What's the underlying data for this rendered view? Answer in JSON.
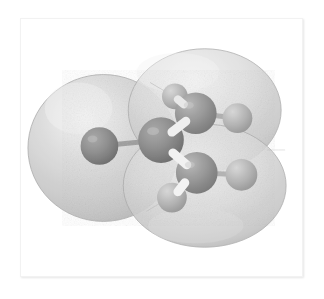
{
  "figure": {
    "kind": "molecular-model",
    "title": "Ball-and-stick molecular model with translucent van der Waals electron-density isosurface",
    "render_style": "grayscale halftone print",
    "background_color": "#ffffff",
    "frame": {
      "x": 20,
      "y": 18,
      "width": 283,
      "height": 259,
      "border_color": "#f2f2f2",
      "fill_color": "#ffffff",
      "shadow_color": "rgba(0,0,0,0.10)"
    }
  },
  "surface": {
    "name": "electron-density-isosurface",
    "opacity": 0.72,
    "fill_light": "#e9e9e9",
    "fill_mid": "#c9c9c9",
    "fill_dark": "#a6a6a6",
    "edge_color": "#9a9a9a",
    "lobes": [
      {
        "name": "left-lobe",
        "cx": 103,
        "cy": 148,
        "rx": 76,
        "ry": 74
      },
      {
        "name": "upper-right-lobe",
        "cx": 205,
        "cy": 110,
        "rx": 77,
        "ry": 62
      },
      {
        "name": "lower-right-lobe",
        "cx": 205,
        "cy": 186,
        "rx": 82,
        "ry": 62
      }
    ]
  },
  "atoms": [
    {
      "id": "A1",
      "label": "heavy-atom-left",
      "element_shade": "dark",
      "cx": 99,
      "cy": 146,
      "r": 19,
      "fill": "#7b7b7b",
      "highlight": "#a8a8a8"
    },
    {
      "id": "A2",
      "label": "carbon-center",
      "element_shade": "dark",
      "cx": 161,
      "cy": 140,
      "r": 23,
      "fill": "#7d7d7d",
      "highlight": "#ababab"
    },
    {
      "id": "A3",
      "label": "carbon-upper-right",
      "element_shade": "mid",
      "cx": 196,
      "cy": 113,
      "r": 21,
      "fill": "#8a8a8a",
      "highlight": "#b4b4b4"
    },
    {
      "id": "A4",
      "label": "carbon-lower-right",
      "element_shade": "mid",
      "cx": 197,
      "cy": 173,
      "r": 21,
      "fill": "#8c8c8c",
      "highlight": "#b6b6b6"
    },
    {
      "id": "A5",
      "label": "hydrogen-top",
      "element_shade": "light",
      "cx": 175,
      "cy": 96,
      "r": 13,
      "fill": "#b2b2b2",
      "highlight": "#d2d2d2"
    },
    {
      "id": "A6",
      "label": "hydrogen-bottom",
      "element_shade": "light",
      "cx": 172,
      "cy": 198,
      "r": 15,
      "fill": "#9f9f9f",
      "highlight": "#c6c6c6"
    },
    {
      "id": "A7",
      "label": "hydrogen-upper-right",
      "element_shade": "light",
      "cx": 238,
      "cy": 118,
      "r": 15,
      "fill": "#aeaeae",
      "highlight": "#cfcfcf"
    },
    {
      "id": "A8",
      "label": "hydrogen-lower-right",
      "element_shade": "light",
      "cx": 242,
      "cy": 175,
      "r": 16,
      "fill": "#b0b0b0",
      "highlight": "#d0d0d0"
    }
  ],
  "bonds": [
    {
      "name": "bond-A1-A2",
      "from": "A1",
      "to": "A2",
      "width": 5,
      "color": "#8f8f8f"
    },
    {
      "name": "bond-A2-A3",
      "from": "A2",
      "to": "A3",
      "width": 10,
      "color": "#e3e3e3"
    },
    {
      "name": "bond-A2-A4",
      "from": "A2",
      "to": "A4",
      "width": 10,
      "color": "#e8e8e8"
    },
    {
      "name": "bond-A3-A5",
      "from": "A3",
      "to": "A5",
      "width": 8,
      "color": "#dcdcdc"
    },
    {
      "name": "bond-A3-A7",
      "from": "A3",
      "to": "A7",
      "width": 5,
      "color": "#9e9e9e"
    },
    {
      "name": "bond-A4-A6",
      "from": "A4",
      "to": "A6",
      "width": 9,
      "color": "#f0f0f0"
    },
    {
      "name": "bond-A4-A8",
      "from": "A4",
      "to": "A8",
      "width": 5,
      "color": "#a2a2a2"
    }
  ]
}
